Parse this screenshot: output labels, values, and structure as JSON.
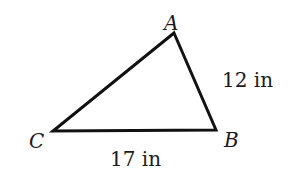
{
  "diagram": {
    "type": "triangle",
    "vertices": {
      "A": {
        "label": "A",
        "x": 174,
        "y": 33
      },
      "B": {
        "label": "B",
        "x": 216,
        "y": 130
      },
      "C": {
        "label": "C",
        "x": 53,
        "y": 131
      }
    },
    "sides": {
      "AB": {
        "label": "12 in"
      },
      "CB": {
        "label": "17 in"
      }
    },
    "stroke_color": "#111111"
  }
}
